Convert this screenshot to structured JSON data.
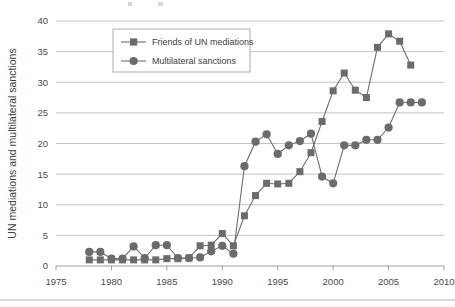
{
  "chart_data": {
    "type": "line",
    "title": "",
    "subtitle": "",
    "xlabel": "",
    "ylabel": "UN mediations and multilateral sanctions",
    "xlim": [
      1975,
      2010
    ],
    "ylim": [
      0,
      40
    ],
    "xticks": [
      1975,
      1980,
      1985,
      1990,
      1995,
      2000,
      2005,
      2010
    ],
    "yticks": [
      0,
      5,
      10,
      15,
      20,
      25,
      30,
      35,
      40
    ],
    "xtick_labels": [
      "1975",
      "1980",
      "1985",
      "1990",
      "1995",
      "2000",
      "2005",
      "2010"
    ],
    "ytick_labels": [
      "0",
      "5",
      "10",
      "15",
      "20",
      "25",
      "30",
      "35",
      "40"
    ],
    "grid": true,
    "grid_axis": "y",
    "legend_position": "upper-left-inside",
    "marker_color": "#6b6b6b",
    "line_color": "#6f6f6f",
    "series": [
      {
        "name": "Friends of UN mediations",
        "marker": "square",
        "color": "#6b6b6b",
        "x": [
          1978,
          1979,
          1980,
          1981,
          1982,
          1983,
          1984,
          1985,
          1986,
          1987,
          1988,
          1989,
          1990,
          1991,
          1992,
          1993,
          1994,
          1995,
          1996,
          1997,
          1998,
          1999,
          2000,
          2001,
          2002,
          2003,
          2004,
          2005,
          2006,
          2007
        ],
        "values": [
          1,
          1,
          1,
          1,
          1,
          1,
          1,
          1.2,
          1.2,
          1.3,
          3.3,
          3.4,
          5.3,
          3.3,
          8.2,
          11.5,
          13.5,
          13.4,
          13.5,
          15.4,
          18.5,
          23.6,
          28.6,
          31.5,
          28.7,
          27.5,
          35.7,
          37.9,
          36.7,
          32.8
        ]
      },
      {
        "name": "Multilateral sanctions",
        "marker": "circle",
        "color": "#6b6b6b",
        "x": [
          1978,
          1979,
          1980,
          1981,
          1982,
          1983,
          1984,
          1985,
          1986,
          1987,
          1988,
          1989,
          1990,
          1991,
          1992,
          1993,
          1994,
          1995,
          1996,
          1997,
          1998,
          1999,
          2000,
          2001,
          2002,
          2003,
          2004,
          2005,
          2006,
          2007,
          2008
        ],
        "values": [
          2.3,
          2.3,
          1.2,
          1.2,
          3.2,
          1.3,
          3.4,
          3.4,
          1.3,
          1.3,
          1.4,
          2.4,
          3.3,
          2,
          16.3,
          20.3,
          21.5,
          18.3,
          19.7,
          20.4,
          21.6,
          14.6,
          13.5,
          19.7,
          19.7,
          20.6,
          20.6,
          22.6,
          26.7,
          26.7,
          26.7
        ]
      }
    ],
    "legend": [
      {
        "label": "Friends of UN mediations",
        "marker": "square"
      },
      {
        "label": "Multilateral sanctions",
        "marker": "circle"
      }
    ]
  }
}
